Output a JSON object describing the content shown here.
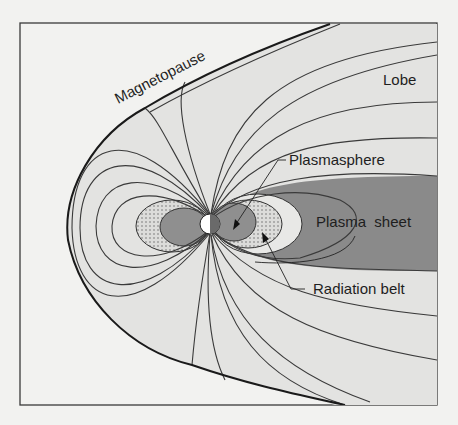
{
  "figure": {
    "labels": {
      "magnetopause": "Magnetopause",
      "lobe": "Lobe",
      "plasmasphere": "Plasmasphere",
      "plasma_sheet": "Plasma  sheet",
      "radiation_belt": "Radiation belt"
    },
    "colors": {
      "background": "#f2f2f0",
      "magnetosphere_fill": "#e3e3e1",
      "plasma_sheet_fill": "#8a8a8a",
      "plasmasphere_fill": "#8f8f8f",
      "radiation_belt_fill": "#dcdcda",
      "inner_light_region": "#e8e8e6",
      "line_color": "#2a2a2a",
      "earth_day": "#ffffff",
      "earth_night": "#6a6a6a"
    }
  }
}
